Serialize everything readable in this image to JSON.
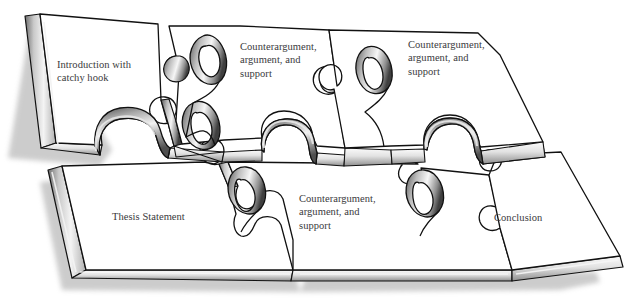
{
  "figure": {
    "background_color": "#ffffff",
    "ink_color": "#111111",
    "text_color": "#3a3a3c",
    "face_color": "#ffffff",
    "shadow_color": "#8d8d8d",
    "grid": {
      "columns": 3,
      "rows": 2,
      "total_pieces": 6
    }
  },
  "pieces": {
    "top_left": {
      "label": "Introduction with\ncatchy hook",
      "row": 1,
      "column": 1
    },
    "top_middle": {
      "label": "Counterargument,\nargument, and\nsupport",
      "row": 1,
      "column": 2
    },
    "top_right": {
      "label": "Counterargument,\nargument, and\nsupport",
      "row": 1,
      "column": 3
    },
    "bottom_left": {
      "label": "Thesis Statement",
      "row": 2,
      "column": 1
    },
    "bottom_middle": {
      "label": "Counterargument,\nargument, and\nsupport",
      "row": 2,
      "column": 2
    },
    "bottom_right": {
      "label": "Conclusion",
      "row": 2,
      "column": 3
    }
  }
}
